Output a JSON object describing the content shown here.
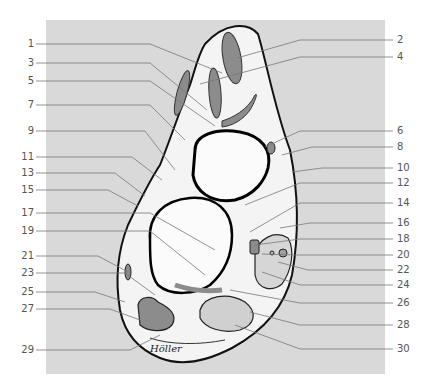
{
  "figure": {
    "signature": "Höller",
    "colors": {
      "background_panel": "#d9d9d9",
      "outline": "#111111",
      "tissue_fill": "#f4f4f4",
      "muscle_fill": "#8c8c8c",
      "leader_line": "#777777",
      "label_text": "#555555"
    }
  },
  "labels_left": [
    {
      "num": "1",
      "y": 44,
      "tx": 222,
      "ty": 73
    },
    {
      "num": "3",
      "y": 63,
      "tx": 207,
      "ty": 110
    },
    {
      "num": "5",
      "y": 81,
      "tx": 215,
      "ty": 126
    },
    {
      "num": "7",
      "y": 105,
      "tx": 185,
      "ty": 140
    },
    {
      "num": "9",
      "y": 131,
      "tx": 175,
      "ty": 170
    },
    {
      "num": "11",
      "y": 157,
      "tx": 162,
      "ty": 180
    },
    {
      "num": "13",
      "y": 173,
      "tx": 145,
      "ty": 196
    },
    {
      "num": "15",
      "y": 190,
      "tx": 138,
      "ty": 206
    },
    {
      "num": "17",
      "y": 213,
      "tx": 215,
      "ty": 250
    },
    {
      "num": "19",
      "y": 231,
      "tx": 205,
      "ty": 275
    },
    {
      "num": "21",
      "y": 256,
      "tx": 128,
      "ty": 272
    },
    {
      "num": "23",
      "y": 273,
      "tx": 155,
      "ty": 295
    },
    {
      "num": "25",
      "y": 292,
      "tx": 125,
      "ty": 302
    },
    {
      "num": "27",
      "y": 309,
      "tx": 140,
      "ty": 320
    },
    {
      "num": "29",
      "y": 350,
      "tx": 160,
      "ty": 335
    }
  ],
  "labels_right": [
    {
      "num": "2",
      "y": 40,
      "tx": 237,
      "ty": 58
    },
    {
      "num": "4",
      "y": 57,
      "tx": 200,
      "ty": 84
    },
    {
      "num": "6",
      "y": 131,
      "tx": 265,
      "ty": 147
    },
    {
      "num": "8",
      "y": 147,
      "tx": 282,
      "ty": 155
    },
    {
      "num": "10",
      "y": 168,
      "tx": 292,
      "ty": 172
    },
    {
      "num": "12",
      "y": 183,
      "tx": 245,
      "ty": 205
    },
    {
      "num": "14",
      "y": 203,
      "tx": 250,
      "ty": 232
    },
    {
      "num": "16",
      "y": 223,
      "tx": 280,
      "ty": 228
    },
    {
      "num": "18",
      "y": 239,
      "tx": 255,
      "ty": 245
    },
    {
      "num": "20",
      "y": 255,
      "tx": 262,
      "ty": 254
    },
    {
      "num": "22",
      "y": 270,
      "tx": 278,
      "ty": 262
    },
    {
      "num": "24",
      "y": 285,
      "tx": 262,
      "ty": 272
    },
    {
      "num": "26",
      "y": 303,
      "tx": 230,
      "ty": 290
    },
    {
      "num": "28",
      "y": 325,
      "tx": 250,
      "ty": 312
    },
    {
      "num": "30",
      "y": 349,
      "tx": 235,
      "ty": 325
    }
  ]
}
